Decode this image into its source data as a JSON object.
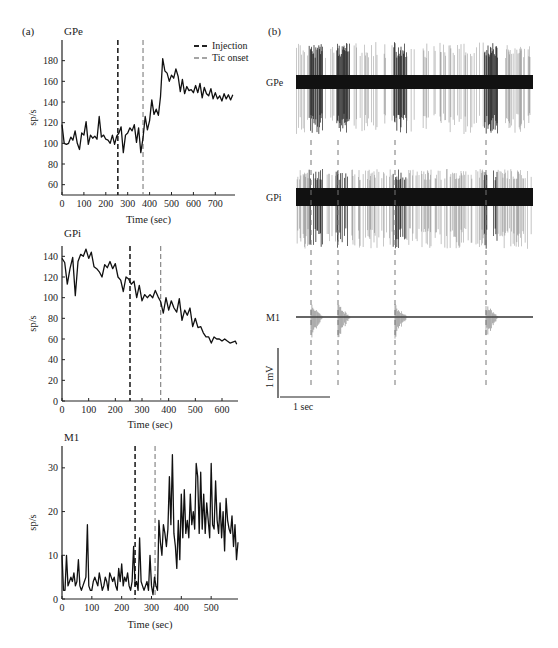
{
  "panel_labels": {
    "a": "(a)",
    "b": "(b)"
  },
  "legend": {
    "injection": "Injection",
    "tic_onset": "Tic onset"
  },
  "scale_bar": {
    "vertical": "1 mV",
    "horizontal": "1 sec"
  },
  "raw_traces": {
    "labels": [
      "GPe",
      "GPi",
      "M1"
    ],
    "tic_marker_positions_px": [
      311,
      338,
      395,
      486
    ]
  },
  "colors": {
    "trace": "#111111",
    "injection_line": "#222222",
    "tic_line": "#888888",
    "axis": "#222222"
  },
  "chart_data": [
    {
      "type": "line",
      "title": "GPe",
      "xlabel": "Time (sec)",
      "ylabel": "sp/s",
      "xlim": [
        0,
        790
      ],
      "ylim": [
        50,
        200
      ],
      "xticks": [
        0,
        100,
        200,
        300,
        400,
        500,
        600,
        700
      ],
      "yticks": [
        60,
        80,
        100,
        120,
        140,
        160,
        180
      ],
      "grid": false,
      "legend": [
        "Injection",
        "Tic onset"
      ],
      "legend_position": "upper right",
      "annotations": [
        {
          "type": "vline",
          "x": 255,
          "label": "Injection",
          "style": "dashed-dark"
        },
        {
          "type": "vline",
          "x": 370,
          "label": "Tic onset",
          "style": "dashed-light"
        }
      ],
      "x": [
        0,
        10,
        20,
        30,
        40,
        50,
        60,
        70,
        80,
        90,
        100,
        110,
        120,
        130,
        140,
        150,
        160,
        170,
        180,
        190,
        200,
        210,
        220,
        230,
        240,
        250,
        260,
        270,
        280,
        290,
        300,
        310,
        320,
        330,
        340,
        350,
        360,
        370,
        380,
        390,
        400,
        410,
        420,
        430,
        440,
        450,
        460,
        470,
        480,
        490,
        500,
        510,
        520,
        530,
        540,
        550,
        560,
        570,
        580,
        590,
        600,
        610,
        620,
        630,
        640,
        650,
        660,
        670,
        680,
        690,
        700,
        710,
        720,
        730,
        740,
        750,
        760,
        770,
        780
      ],
      "values": [
        118,
        100,
        99,
        100,
        106,
        103,
        112,
        100,
        94,
        110,
        108,
        121,
        99,
        108,
        105,
        107,
        104,
        126,
        106,
        108,
        104,
        103,
        100,
        108,
        99,
        107,
        110,
        116,
        91,
        108,
        110,
        115,
        112,
        118,
        101,
        115,
        91,
        105,
        126,
        113,
        122,
        142,
        128,
        133,
        127,
        145,
        182,
        170,
        168,
        160,
        166,
        163,
        172,
        165,
        150,
        162,
        148,
        155,
        151,
        152,
        149,
        156,
        149,
        158,
        144,
        154,
        148,
        146,
        153,
        143,
        149,
        143,
        146,
        141,
        148,
        143,
        147,
        142,
        147
      ]
    },
    {
      "type": "line",
      "title": "GPi",
      "xlabel": "Time (sec)",
      "ylabel": "sp/s",
      "xlim": [
        0,
        660
      ],
      "ylim": [
        0,
        150
      ],
      "xticks": [
        0,
        100,
        200,
        300,
        400,
        500,
        600
      ],
      "yticks": [
        0,
        20,
        40,
        60,
        80,
        100,
        120,
        140
      ],
      "grid": false,
      "annotations": [
        {
          "type": "vline",
          "x": 255,
          "label": "Injection",
          "style": "dashed-dark"
        },
        {
          "type": "vline",
          "x": 370,
          "label": "Tic onset",
          "style": "dashed-light"
        }
      ],
      "x": [
        0,
        10,
        20,
        30,
        40,
        50,
        60,
        70,
        80,
        90,
        100,
        110,
        120,
        130,
        140,
        150,
        160,
        170,
        180,
        190,
        200,
        210,
        220,
        230,
        240,
        250,
        260,
        270,
        280,
        290,
        300,
        310,
        320,
        330,
        340,
        350,
        360,
        370,
        380,
        390,
        400,
        410,
        420,
        430,
        440,
        450,
        460,
        470,
        480,
        490,
        500,
        510,
        520,
        530,
        540,
        550,
        560,
        570,
        580,
        590,
        600,
        610,
        620,
        630,
        640,
        650,
        655
      ],
      "values": [
        138,
        134,
        113,
        128,
        139,
        102,
        135,
        142,
        140,
        147,
        138,
        144,
        130,
        128,
        125,
        120,
        132,
        129,
        135,
        128,
        133,
        120,
        117,
        106,
        120,
        118,
        113,
        116,
        100,
        112,
        97,
        103,
        100,
        103,
        100,
        107,
        101,
        96,
        85,
        100,
        88,
        97,
        90,
        86,
        99,
        78,
        88,
        83,
        90,
        72,
        80,
        71,
        72,
        66,
        62,
        62,
        56,
        62,
        60,
        60,
        58,
        60,
        58,
        56,
        57,
        58,
        55
      ]
    },
    {
      "type": "line",
      "title": "M1",
      "xlabel": "Time (sec)",
      "ylabel": "sp/s",
      "xlim": [
        0,
        590
      ],
      "ylim": [
        0,
        35
      ],
      "xticks": [
        0,
        100,
        200,
        300,
        400,
        500
      ],
      "yticks": [
        0,
        10,
        20,
        30
      ],
      "grid": false,
      "annotations": [
        {
          "type": "vline",
          "x": 245,
          "label": "Injection",
          "style": "dashed-dark"
        },
        {
          "type": "vline",
          "x": 312,
          "label": "Tic onset",
          "style": "dashed-light"
        }
      ],
      "x": [
        0,
        5,
        10,
        15,
        20,
        25,
        30,
        35,
        40,
        45,
        50,
        55,
        60,
        65,
        70,
        75,
        80,
        85,
        90,
        95,
        100,
        105,
        110,
        115,
        120,
        125,
        130,
        135,
        140,
        145,
        150,
        155,
        160,
        165,
        170,
        175,
        180,
        185,
        190,
        195,
        200,
        205,
        210,
        215,
        220,
        225,
        230,
        235,
        240,
        245,
        250,
        255,
        260,
        265,
        270,
        275,
        280,
        285,
        290,
        295,
        300,
        305,
        310,
        315,
        320,
        325,
        330,
        335,
        340,
        345,
        350,
        355,
        360,
        365,
        370,
        375,
        380,
        385,
        390,
        395,
        400,
        405,
        410,
        415,
        420,
        425,
        430,
        435,
        440,
        445,
        450,
        455,
        460,
        465,
        470,
        475,
        480,
        485,
        490,
        495,
        500,
        505,
        510,
        515,
        520,
        525,
        530,
        535,
        540,
        545,
        550,
        555,
        560,
        565,
        570,
        575,
        580,
        585,
        590
      ],
      "values": [
        10,
        2,
        2,
        10,
        3,
        4,
        5,
        4,
        6,
        3,
        4,
        9,
        3,
        2,
        3,
        4,
        5,
        17,
        3,
        2,
        2,
        4,
        5,
        4,
        3,
        6,
        4,
        2,
        3,
        5,
        4,
        2,
        6,
        5,
        4,
        5,
        3,
        2,
        7,
        4,
        8,
        3,
        5,
        4,
        6,
        3,
        2,
        4,
        12,
        3,
        4,
        2,
        14,
        4,
        3,
        2,
        3,
        4,
        2,
        10,
        3,
        1,
        5,
        3,
        2,
        18,
        13,
        10,
        17,
        15,
        12,
        16,
        28,
        17,
        33,
        15,
        12,
        7,
        18,
        9,
        24,
        14,
        25,
        15,
        18,
        14,
        24,
        17,
        20,
        16,
        31,
        28,
        15,
        29,
        16,
        24,
        15,
        22,
        18,
        14,
        31,
        17,
        16,
        27,
        18,
        15,
        22,
        14,
        20,
        11,
        23,
        18,
        16,
        15,
        19,
        12,
        17,
        9,
        13
      ]
    }
  ]
}
